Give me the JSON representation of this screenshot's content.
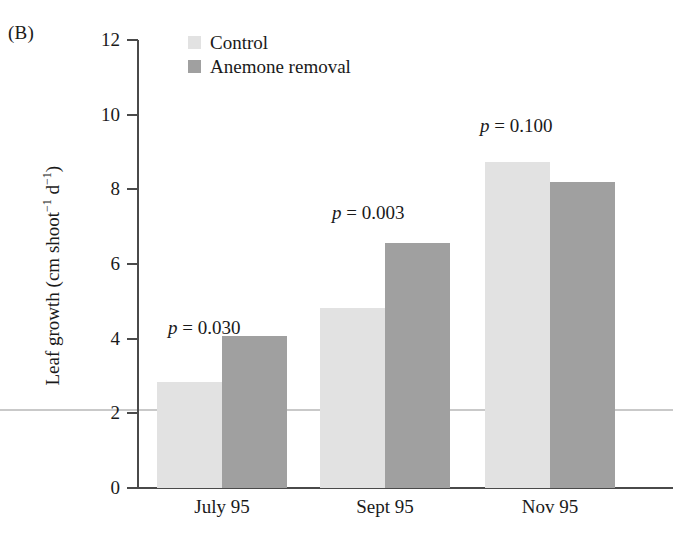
{
  "figure": {
    "panel_label": "(B)",
    "colors": {
      "control": "#e2e2e2",
      "anemone_removal": "#a0a0a0",
      "axis": "#4a4a4a",
      "text": "#1a1a1a",
      "scan_line": "#c9c9c9"
    }
  },
  "chart_data": {
    "type": "bar",
    "title": "",
    "subtitle": "",
    "xlabel": "",
    "ylabel": "Leaf growth (cm shoot⁻¹ d⁻¹)",
    "ylabel_parts": {
      "prefix": "Leaf growth (cm shoot",
      "sup1": "−1",
      "mid": " d",
      "sup2": "−1",
      "suffix": ")"
    },
    "categories": [
      "July 95",
      "Sept 95",
      "Nov 95"
    ],
    "series": [
      {
        "name": "Control",
        "values": [
          2.85,
          4.82,
          8.73
        ]
      },
      {
        "name": "Anemone removal",
        "values": [
          4.07,
          6.55,
          8.2
        ]
      }
    ],
    "ylim": [
      0,
      12
    ],
    "yticks": [
      0,
      2,
      4,
      6,
      8,
      10,
      12
    ],
    "ytick_labels": [
      "0",
      "2",
      "4",
      "6",
      "8",
      "10",
      "12"
    ],
    "grid": false,
    "legend_position": "top-left-inside",
    "annotations": [
      {
        "text": "p = 0.030",
        "symbol": "p",
        "rest": " = 0.030",
        "category": "July 95"
      },
      {
        "text": "p = 0.003",
        "symbol": "p",
        "rest": " = 0.003",
        "category": "Sept 95"
      },
      {
        "text": "p = 0.100",
        "symbol": "p",
        "rest": " = 0.100",
        "category": "Nov 95"
      }
    ]
  },
  "legend": {
    "items": [
      {
        "label": "Control",
        "color": "#e2e2e2"
      },
      {
        "label": "Anemone removal",
        "color": "#a0a0a0"
      }
    ]
  }
}
